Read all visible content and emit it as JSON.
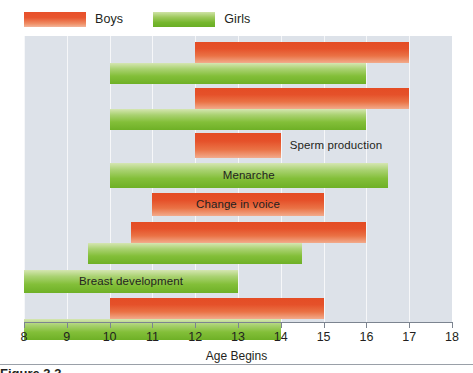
{
  "legend": {
    "items": [
      {
        "label": "Boys",
        "color": "#e5512a",
        "key": "boys"
      },
      {
        "label": "Girls",
        "color": "#83bf39",
        "key": "girls"
      }
    ]
  },
  "axis": {
    "title": "Age Begins",
    "ticks": [
      "8",
      "9",
      "10",
      "11",
      "12",
      "13",
      "14",
      "15",
      "16",
      "17",
      "18"
    ],
    "min": 8,
    "max": 18
  },
  "caption": {
    "text": "Figure 3.3"
  },
  "chart_data": {
    "type": "bar",
    "subtype": "horizontal-range-bar",
    "title": "",
    "xlabel": "Age Begins",
    "ylabel": "",
    "xlim": [
      8,
      18
    ],
    "grid": true,
    "legend_position": "top-left",
    "series": [
      {
        "name": "Boys",
        "color": "#e5512a"
      },
      {
        "name": "Girls",
        "color": "#83bf39"
      }
    ],
    "categories": [
      "Skin oil and sweat",
      "Underarm hair",
      "Sperm production",
      "Menarche",
      "Change in voice",
      "Growth spurt",
      "Breast development",
      "Pubic hair"
    ],
    "bars": [
      {
        "label": "Skin oil and sweat",
        "series": "Boys",
        "start": 12,
        "end": 17,
        "label_placement": "below-center"
      },
      {
        "label": "",
        "series": "Girls",
        "start": 10,
        "end": 16,
        "label_placement": "none"
      },
      {
        "label": "Underarm hair",
        "series": "Boys",
        "start": 12,
        "end": 17,
        "label_placement": "below-center"
      },
      {
        "label": "",
        "series": "Girls",
        "start": 10,
        "end": 16,
        "label_placement": "none"
      },
      {
        "label": "Sperm production",
        "series": "Boys",
        "start": 12,
        "end": 14,
        "label_placement": "outside-right"
      },
      {
        "label": "Menarche",
        "series": "Girls",
        "start": 10,
        "end": 16.5,
        "label_placement": "inside-center"
      },
      {
        "label": "Change in voice",
        "series": "Boys",
        "start": 11,
        "end": 15,
        "label_placement": "inside-center"
      },
      {
        "label": "Growth spurt",
        "series": "Boys",
        "start": 10.5,
        "end": 16,
        "label_placement": "below-center"
      },
      {
        "label": "",
        "series": "Girls",
        "start": 9.5,
        "end": 14.5,
        "label_placement": "none"
      },
      {
        "label": "Breast development",
        "series": "Girls",
        "start": 8,
        "end": 13,
        "label_placement": "inside-center"
      },
      {
        "label": "Pubic hair",
        "series": "Boys",
        "start": 10,
        "end": 15,
        "label_placement": "below-center"
      },
      {
        "label": "",
        "series": "Girls",
        "start": 8,
        "end": 14,
        "label_placement": "none"
      }
    ],
    "rows_layout": [
      {
        "top": 6,
        "height": 21,
        "series": "Boys",
        "start": 12,
        "end": 17,
        "label": "Skin oil and sweat",
        "label_mode": "straddle-below"
      },
      {
        "top": 27,
        "height": 21,
        "series": "Girls",
        "start": 10,
        "end": 16,
        "label": "",
        "label_mode": "none"
      },
      {
        "top": 52,
        "height": 21,
        "series": "Boys",
        "start": 12,
        "end": 17,
        "label": "Underarm hair",
        "label_mode": "straddle-below"
      },
      {
        "top": 73,
        "height": 21,
        "series": "Girls",
        "start": 10,
        "end": 16,
        "label": "",
        "label_mode": "none"
      },
      {
        "top": 97,
        "height": 25,
        "series": "Boys",
        "start": 12,
        "end": 14,
        "label": "Sperm production",
        "label_mode": "outside-right"
      },
      {
        "top": 127,
        "height": 25,
        "series": "Girls",
        "start": 10,
        "end": 16.5,
        "label": "Menarche",
        "label_mode": "inside"
      },
      {
        "top": 157,
        "height": 23,
        "series": "Boys",
        "start": 11,
        "end": 15,
        "label": "Change in voice",
        "label_mode": "inside"
      },
      {
        "top": 186,
        "height": 21,
        "series": "Boys",
        "start": 10.5,
        "end": 16,
        "label": "Growth spurt",
        "label_mode": "straddle-below"
      },
      {
        "top": 207,
        "height": 21,
        "series": "Girls",
        "start": 9.5,
        "end": 14.5,
        "label": "",
        "label_mode": "none"
      },
      {
        "top": 234,
        "height": 23,
        "series": "Girls",
        "start": 8,
        "end": 13,
        "label": "Breast development",
        "label_mode": "inside"
      },
      {
        "top": 262,
        "height": 21,
        "series": "Boys",
        "start": 10,
        "end": 15,
        "label": "Pubic hair",
        "label_mode": "straddle-below"
      },
      {
        "top": 283,
        "height": 21,
        "series": "Girls",
        "start": 8,
        "end": 14,
        "label": "",
        "label_mode": "none"
      }
    ]
  }
}
